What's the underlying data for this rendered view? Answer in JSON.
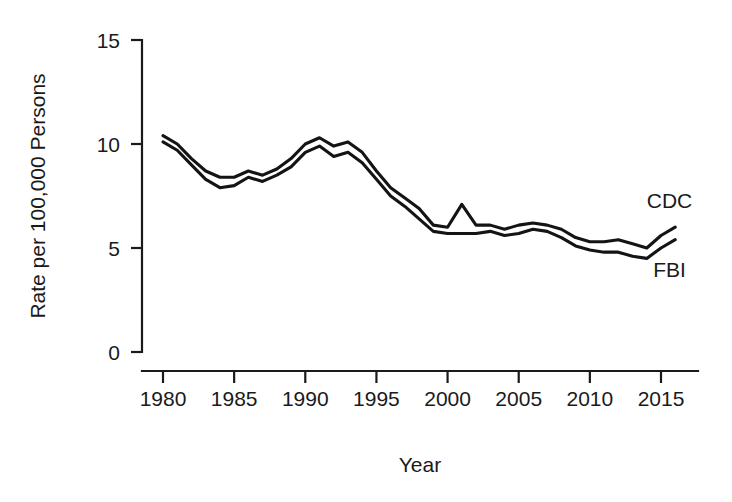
{
  "chart_data": {
    "type": "line",
    "title": "",
    "xlabel": "Year",
    "ylabel": "Rate per 100,000 Persons",
    "xlim": [
      1979,
      2016.6
    ],
    "ylim": [
      0,
      16.2
    ],
    "xticks": [
      1980,
      1985,
      1990,
      1995,
      2000,
      2005,
      2010,
      2015
    ],
    "xtick_labels": [
      "1980",
      "1985",
      "1990",
      "1995",
      "2000",
      "2005",
      "2010",
      "2015"
    ],
    "yticks": [
      0,
      5,
      10,
      15
    ],
    "ytick_labels": [
      "0",
      "5",
      "10",
      "15"
    ],
    "grid": false,
    "legend_position": "inline-right-end",
    "x": [
      1980,
      1981,
      1982,
      1983,
      1984,
      1985,
      1986,
      1987,
      1988,
      1989,
      1990,
      1991,
      1992,
      1993,
      1994,
      1995,
      1996,
      1997,
      1998,
      1999,
      2000,
      2001,
      2002,
      2003,
      2004,
      2005,
      2006,
      2007,
      2008,
      2009,
      2010,
      2011,
      2012,
      2013,
      2014,
      2015,
      2016
    ],
    "series": [
      {
        "name": "CDC",
        "label": "CDC",
        "color": "#141414",
        "values": [
          10.4,
          10.0,
          9.3,
          8.7,
          8.4,
          8.4,
          8.7,
          8.5,
          8.8,
          9.3,
          10.0,
          10.3,
          9.9,
          10.1,
          9.6,
          8.7,
          7.9,
          7.4,
          6.9,
          6.1,
          6.0,
          7.1,
          6.1,
          6.1,
          5.9,
          6.1,
          6.2,
          6.1,
          5.9,
          5.5,
          5.3,
          5.3,
          5.4,
          5.2,
          5.0,
          5.6,
          6.0
        ]
      },
      {
        "name": "FBI",
        "label": "FBI",
        "color": "#141414",
        "values": [
          10.1,
          9.7,
          9.0,
          8.3,
          7.9,
          8.0,
          8.4,
          8.2,
          8.5,
          8.9,
          9.6,
          9.9,
          9.4,
          9.6,
          9.1,
          8.3,
          7.5,
          7.0,
          6.4,
          5.8,
          5.7,
          5.7,
          5.7,
          5.8,
          5.6,
          5.7,
          5.9,
          5.8,
          5.5,
          5.1,
          4.9,
          4.8,
          4.8,
          4.6,
          4.5,
          5.0,
          5.4
        ]
      }
    ],
    "annotations": [
      {
        "text": "CDC",
        "series": "CDC",
        "x": 2015.6,
        "y": 6.9
      },
      {
        "text": "FBI",
        "series": "FBI",
        "x": 2015.6,
        "y": 3.6
      }
    ]
  }
}
